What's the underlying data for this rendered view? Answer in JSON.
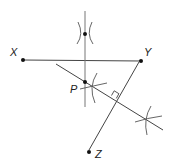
{
  "diagram": {
    "type": "geometric-construction",
    "colors": {
      "stroke": "#444444",
      "point": "#111111",
      "background": "#ffffff"
    },
    "points": {
      "X": {
        "label": "X",
        "x": 23,
        "y": 60
      },
      "Y": {
        "label": "Y",
        "x": 141,
        "y": 61
      },
      "P": {
        "label": "P",
        "x": 85,
        "y": 82
      },
      "Z": {
        "label": "Z",
        "x": 89,
        "y": 152
      },
      "top": {
        "label": "",
        "x": 85,
        "y": 34
      }
    },
    "segments": [
      {
        "name": "XY",
        "x1": 23,
        "y1": 60,
        "x2": 141,
        "y2": 61
      },
      {
        "name": "vertical-line",
        "x1": 85,
        "y1": 11,
        "x2": 85,
        "y2": 107
      },
      {
        "name": "YZ",
        "x1": 139,
        "y1": 62,
        "x2": 89,
        "y2": 150
      },
      {
        "name": "perpendicular-line",
        "x1": 56,
        "y1": 64,
        "x2": 163,
        "y2": 130
      }
    ],
    "right_angle_marker": {
      "at_x": 116,
      "at_y": 98
    }
  }
}
